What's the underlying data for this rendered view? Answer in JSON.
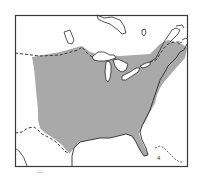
{
  "map": {
    "type": "species-range-map",
    "region": "Eastern North America",
    "colors": {
      "background": "#ffffff",
      "frame": "#3a3a3a",
      "range_fill": "#a9a9a9",
      "coastline": "#2a2a2a",
      "border_dashed": "#3a3a3a",
      "water": "#ffffff"
    },
    "legend": {
      "shaded": "species range"
    },
    "features": [
      {
        "name": "Hudson Bay",
        "kind": "water"
      },
      {
        "name": "James Bay",
        "kind": "water"
      },
      {
        "name": "Great Lakes",
        "kind": "water"
      },
      {
        "name": "Gulf of Mexico",
        "kind": "water"
      },
      {
        "name": "Atlantic Ocean",
        "kind": "water"
      },
      {
        "name": "US-Canada border",
        "kind": "dashed-border"
      },
      {
        "name": "US-Mexico border",
        "kind": "dashed-border"
      },
      {
        "name": "Florida peninsula",
        "kind": "land"
      },
      {
        "name": "Bahamas / Cuba",
        "kind": "islands"
      }
    ]
  }
}
